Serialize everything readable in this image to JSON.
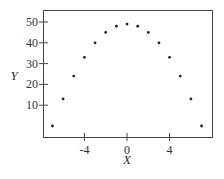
{
  "chart_data": {
    "type": "scatter",
    "title": "",
    "xlabel": "X",
    "ylabel": "Y",
    "x": [
      -7,
      -6,
      -5,
      -4,
      -3,
      -2,
      -1,
      0,
      1,
      2,
      3,
      4,
      5,
      6,
      7
    ],
    "y": [
      0,
      13,
      24,
      33,
      40,
      45,
      48,
      49,
      48,
      45,
      40,
      33,
      24,
      13,
      0
    ],
    "xticks": [
      -4,
      0,
      4
    ],
    "yticks": [
      10,
      20,
      30,
      40,
      50
    ],
    "xlim": [
      -7.8,
      8
    ],
    "ylim": [
      -5.5,
      56
    ],
    "grid": false,
    "legend": null
  },
  "labels": {
    "xticks": [
      "-4",
      "0",
      "4"
    ],
    "yticks": [
      "10",
      "20",
      "30",
      "40",
      "50"
    ],
    "xlabel": "X",
    "ylabel": "Y"
  }
}
